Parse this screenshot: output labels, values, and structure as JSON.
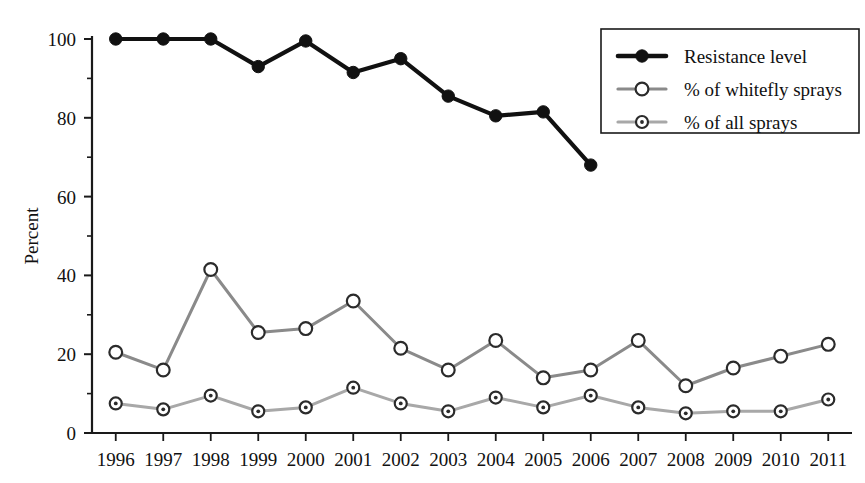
{
  "chart_data": {
    "type": "line",
    "title": "",
    "xlabel": "",
    "ylabel": "Percent",
    "categories": [
      "1996",
      "1997",
      "1998",
      "1999",
      "2000",
      "2001",
      "2002",
      "2003",
      "2004",
      "2005",
      "2006",
      "2007",
      "2008",
      "2009",
      "2010",
      "2011"
    ],
    "ylim": [
      0,
      100
    ],
    "yticks": [
      0,
      20,
      40,
      60,
      80,
      100
    ],
    "yticklabels": [
      "0",
      "20",
      "40",
      "60",
      "80",
      "100"
    ],
    "yminorticks": [
      10,
      30,
      50,
      70,
      90
    ],
    "grid": false,
    "legend_position": "top-right",
    "series": [
      {
        "name": "Resistance level",
        "marker": "filled-circle",
        "color": "#111111",
        "values": [
          100,
          100,
          100,
          93,
          99.5,
          91.5,
          95,
          85.5,
          80.5,
          81.5,
          68,
          null,
          null,
          null,
          null,
          null
        ]
      },
      {
        "name": "% of whitefly sprays",
        "marker": "open-circle",
        "color": "#8a8a8a",
        "values": [
          20.5,
          16,
          41.5,
          25.5,
          26.5,
          33.5,
          21.5,
          16,
          23.5,
          14,
          16,
          23.5,
          12,
          16.5,
          19.5,
          22.5
        ]
      },
      {
        "name": "% of all sprays",
        "marker": "dot-circle",
        "color": "#a8a8a8",
        "values": [
          7.5,
          6,
          9.5,
          5.5,
          6.5,
          11.5,
          7.5,
          5.5,
          9,
          6.5,
          9.5,
          6.5,
          5,
          5.5,
          5.5,
          8.5
        ]
      }
    ],
    "annotations": [
      {
        "text": "*",
        "x_category": "2006",
        "y": 76,
        "note": "asterisk marking last resistance data point"
      }
    ]
  },
  "legend": {
    "items": [
      {
        "label": "Resistance level",
        "marker": "filled-circle"
      },
      {
        "label": "% of whitefly sprays",
        "marker": "open-circle"
      },
      {
        "label": "% of all sprays",
        "marker": "dot-circle"
      }
    ]
  },
  "axes": {
    "y_title": "Percent"
  },
  "colors": {
    "resistance": "#111111",
    "whitefly": "#8a8a8a",
    "all_sprays": "#a8a8a8",
    "axis": "#1a1a1a",
    "background": "#ffffff"
  }
}
